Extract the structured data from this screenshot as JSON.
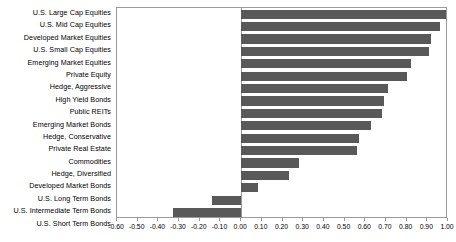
{
  "chart_data": {
    "type": "bar",
    "orientation": "horizontal",
    "title": "",
    "xlabel": "",
    "ylabel": "",
    "xlim": [
      -0.6,
      1.0
    ],
    "xtick_step": 0.1,
    "grid": false,
    "legend": null,
    "bar_color": "#595959",
    "axis_color": "#9a9a9a",
    "categories": [
      "U.S. Large Cap Equities",
      "U.S. Mid Cap Equities",
      "Developed Market Equities",
      "U.S. Small Cap Equities",
      "Emerging Market Equities",
      "Private Equity",
      "Hedge, Aggressive",
      "High Yield Bonds",
      "Public REITs",
      "Emerging Market Bonds",
      "Hedge, Conservative",
      "Private Real Estate",
      "Commodities",
      "Hedge, Diversified",
      "Developed Market Bonds",
      "U.S. Long Term Bonds",
      "U.S. Intermediate Term Bonds",
      "U.S. Short Term Bonds"
    ],
    "values": [
      1.0,
      0.96,
      0.92,
      0.91,
      0.82,
      0.8,
      0.71,
      0.69,
      0.68,
      0.63,
      0.57,
      0.56,
      0.28,
      0.23,
      0.08,
      -0.14,
      -0.33,
      -0.57
    ],
    "xticklabels": [
      "-0.60",
      "-0.50",
      "-0.40",
      "-0.30",
      "-0.20",
      "-0.10",
      "0.00",
      "0.10",
      "0.20",
      "0.30",
      "0.40",
      "0.50",
      "0.60",
      "0.70",
      "0.80",
      "0.90",
      "1.00"
    ],
    "xtickvalues": [
      -0.6,
      -0.5,
      -0.4,
      -0.3,
      -0.2,
      -0.1,
      0.0,
      0.1,
      0.2,
      0.3,
      0.4,
      0.5,
      0.6,
      0.7,
      0.8,
      0.9,
      1.0
    ]
  }
}
